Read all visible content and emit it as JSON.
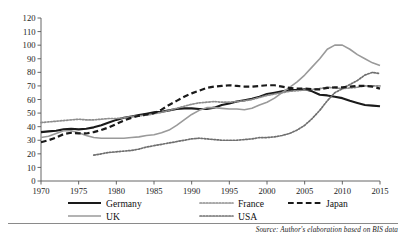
{
  "chart_data": {
    "type": "line",
    "title": "",
    "subtitle": "",
    "xlabel": "",
    "ylabel": "",
    "xlim": [
      1970,
      2015
    ],
    "ylim": [
      0,
      120
    ],
    "ytick_step": 10,
    "xtick_step": 5,
    "grid": false,
    "legend_position": "bottom",
    "yticks": [
      "0",
      "10",
      "20",
      "30",
      "40",
      "50",
      "60",
      "70",
      "80",
      "90",
      "100",
      "110",
      "120"
    ],
    "xticks": [
      "1970",
      "1975",
      "1980",
      "1985",
      "1990",
      "1995",
      "2000",
      "2005",
      "2010",
      "2015"
    ],
    "x": [
      1970,
      1971,
      1972,
      1973,
      1974,
      1975,
      1976,
      1977,
      1978,
      1979,
      1980,
      1981,
      1982,
      1983,
      1984,
      1985,
      1986,
      1987,
      1988,
      1989,
      1990,
      1991,
      1992,
      1993,
      1994,
      1995,
      1996,
      1997,
      1998,
      1999,
      2000,
      2001,
      2002,
      2003,
      2004,
      2005,
      2006,
      2007,
      2008,
      2009,
      2010,
      2011,
      2012,
      2013,
      2014,
      2015
    ],
    "series": [
      {
        "name": "Germany",
        "style": "solid",
        "color": "#1a1a1a",
        "width": 2.1,
        "values": [
          36,
          36.5,
          37,
          38,
          38.5,
          38,
          38.5,
          39.5,
          41,
          43,
          45,
          46.5,
          47.5,
          48.5,
          49.5,
          50.5,
          51,
          52,
          53,
          53.5,
          53.5,
          53,
          53,
          54,
          56,
          57,
          58.5,
          59.5,
          60.5,
          62,
          64,
          65,
          66,
          67,
          67,
          67.5,
          66,
          63.5,
          63,
          62,
          61,
          59,
          57.5,
          56,
          55.5,
          55
        ]
      },
      {
        "name": "UK",
        "style": "solid",
        "color": "#9a9a9a",
        "width": 1.6,
        "values": [
          32,
          33,
          35,
          37,
          37,
          35.5,
          33.5,
          32,
          31.5,
          31.5,
          31.5,
          31.5,
          32,
          32.5,
          33.5,
          34,
          35.5,
          37.5,
          41,
          45,
          49,
          52,
          54,
          54,
          53.5,
          53,
          53,
          52.5,
          53.5,
          56,
          58,
          61,
          65,
          69,
          73,
          78,
          84,
          90,
          97,
          100,
          100,
          97,
          93,
          90,
          87,
          85
        ]
      },
      {
        "name": "France",
        "style": "dotted",
        "color": "#8d8d8d",
        "width": 1.7,
        "values": [
          43,
          43.5,
          44,
          44.5,
          45,
          45.5,
          45,
          45,
          45.5,
          46,
          46,
          46.5,
          47.5,
          48,
          48.5,
          49.5,
          50.5,
          52,
          53.5,
          55,
          56.5,
          57.5,
          58,
          58.5,
          58,
          58,
          58.5,
          59,
          60,
          61.5,
          63,
          64,
          65,
          66,
          66.5,
          67,
          67.5,
          68,
          69,
          68.5,
          68,
          68.5,
          69,
          70,
          70,
          70
        ]
      },
      {
        "name": "USA",
        "style": "dotted",
        "color": "#6f6f6f",
        "width": 1.7,
        "values": [
          null,
          null,
          null,
          null,
          null,
          null,
          null,
          19,
          20,
          21,
          21.5,
          22,
          22.5,
          23.5,
          25,
          26,
          27,
          28,
          29,
          30,
          31,
          31.5,
          31,
          30.5,
          30,
          30,
          30,
          30.5,
          31,
          32,
          32,
          32.5,
          33.5,
          35,
          37.5,
          41,
          46,
          52,
          59,
          65,
          68,
          71,
          74,
          78,
          80,
          79
        ]
      },
      {
        "name": "Japan",
        "style": "dashed",
        "color": "#1a1a1a",
        "width": 2.2,
        "values": [
          28.5,
          30,
          32,
          34.5,
          35.5,
          35,
          35,
          36,
          37.5,
          39.5,
          42,
          44.5,
          46.5,
          48,
          49,
          50,
          52.5,
          56,
          59,
          62,
          64.5,
          66.5,
          68.5,
          69.5,
          70,
          70.5,
          70,
          69.5,
          69.5,
          70,
          70.5,
          70.5,
          69.5,
          68.5,
          68,
          68,
          67.5,
          67.5,
          68.5,
          69,
          69,
          69.5,
          70,
          70,
          69.5,
          68
        ]
      }
    ]
  },
  "legend": {
    "entries": [
      {
        "label": "Germany",
        "style": "solid",
        "color": "#1a1a1a"
      },
      {
        "label": "France",
        "style": "dotted",
        "color": "#8d8d8d"
      },
      {
        "label": "Japan",
        "style": "dashed",
        "color": "#1a1a1a"
      },
      {
        "label": "UK",
        "style": "solid",
        "color": "#9a9a9a"
      },
      {
        "label": "USA",
        "style": "dotted",
        "color": "#6f6f6f"
      }
    ]
  },
  "source": {
    "note": "Source: Author's elaboration based on BIS data"
  }
}
